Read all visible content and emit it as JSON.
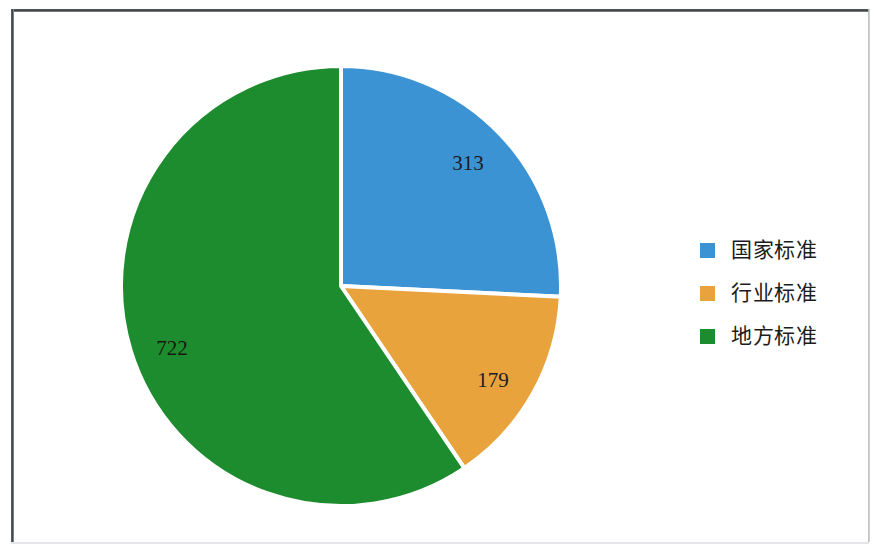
{
  "chart_data": {
    "type": "pie",
    "title": "",
    "subtitle": "",
    "xlabel": "",
    "ylabel": "",
    "categories": [
      "国家标准",
      "行业标准",
      "地方标准"
    ],
    "values": [
      313,
      179,
      722
    ],
    "total": 1214,
    "data_labels": [
      "313",
      "179",
      "722"
    ],
    "colors": [
      "#3b93d4",
      "#e8a33d",
      "#1d8c2e"
    ],
    "slice_separator_color": "#ffffff",
    "start_angle_deg": 0,
    "direction": "clockwise",
    "grid": false,
    "legend": {
      "position": "right",
      "entries": [
        {
          "label": "国家标准",
          "color": "#3b93d4",
          "value": 313
        },
        {
          "label": "行业标准",
          "color": "#e8a33d",
          "value": 179
        },
        {
          "label": "地方标准",
          "color": "#1d8c2e",
          "value": 722
        }
      ]
    },
    "geometry": {
      "center_x": 341,
      "center_y": 286,
      "radius": 220
    },
    "slices": [
      {
        "name": "国家标准",
        "value": 313,
        "label": "313",
        "color": "#3b93d4",
        "start_deg": 0,
        "end_deg": 92.8,
        "label_x": 468,
        "label_y": 165
      },
      {
        "name": "行业标准",
        "value": 179,
        "label": "179",
        "color": "#e8a33d",
        "start_deg": 92.8,
        "end_deg": 145.9,
        "label_x": 493,
        "label_y": 382
      },
      {
        "name": "地方标准",
        "value": 722,
        "label": "722",
        "color": "#1d8c2e",
        "start_deg": 145.9,
        "end_deg": 360,
        "label_x": 172,
        "label_y": 350
      }
    ]
  },
  "figure": {
    "background": "#ffffff",
    "frame_color": "#3a3d42"
  }
}
